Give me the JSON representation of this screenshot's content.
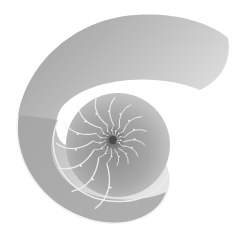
{
  "image": {
    "subject": "nautilus shell cross-section",
    "style": "grayscale photograph",
    "background_color": "#ffffff",
    "shell_light_color": "#e4e4e4",
    "shell_mid_color": "#b2b2b2",
    "shell_dark_color": "#6e6e6e",
    "septa_color": "#f2f2f2",
    "chamber_count": 28
  }
}
